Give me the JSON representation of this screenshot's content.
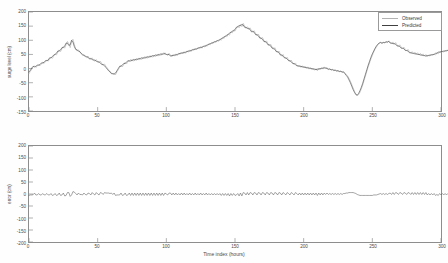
{
  "figure": {
    "background_color": "#fefefe",
    "axis_color": "#8d8d8d",
    "text_color": "#4a4a4a"
  },
  "legend": {
    "position": "top-right",
    "entries": [
      {
        "label": "Observed",
        "color": "#b2b2b2"
      },
      {
        "label": "Predicted",
        "color": "#404040"
      }
    ]
  },
  "chart_data": [
    {
      "id": "surge-level-panel",
      "type": "line",
      "title": "",
      "xlabel": "",
      "ylabel": "surge level (cm)",
      "xlim": [
        0,
        300
      ],
      "ylim": [
        -150,
        200
      ],
      "xticks": [
        0,
        50,
        100,
        150,
        200,
        250,
        300
      ],
      "yticks": [
        -150,
        -100,
        -50,
        0,
        50,
        100,
        150,
        200
      ],
      "grid": false,
      "legend_position": "upper right",
      "x_step": 1,
      "series": [
        {
          "name": "Observed",
          "color": "#b2b2b2",
          "values": [
            -18,
            -10,
            -2,
            5,
            10,
            4,
            8,
            14,
            10,
            16,
            22,
            18,
            25,
            30,
            26,
            34,
            40,
            36,
            44,
            52,
            48,
            58,
            66,
            60,
            70,
            78,
            72,
            84,
            96,
            88,
            74,
            96,
            104,
            86,
            70,
            62,
            66,
            58,
            52,
            46,
            50,
            42,
            38,
            44,
            36,
            32,
            38,
            30,
            26,
            32,
            24,
            20,
            26,
            18,
            12,
            16,
            8,
            2,
            -4,
            -10,
            -14,
            -20,
            -16,
            -22,
            -12,
            -4,
            4,
            12,
            6,
            14,
            22,
            16,
            24,
            30,
            24,
            32,
            26,
            34,
            28,
            36,
            30,
            38,
            32,
            40,
            34,
            42,
            36,
            44,
            38,
            46,
            40,
            48,
            42,
            50,
            44,
            52,
            46,
            54,
            48,
            56,
            50,
            46,
            54,
            48,
            42,
            50,
            44,
            52,
            46,
            54,
            50,
            58,
            52,
            60,
            54,
            62,
            58,
            66,
            60,
            68,
            64,
            72,
            66,
            74,
            70,
            78,
            72,
            80,
            76,
            84,
            80,
            88,
            84,
            92,
            88,
            96,
            92,
            100,
            96,
            104,
            100,
            110,
            106,
            116,
            112,
            122,
            118,
            130,
            126,
            136,
            132,
            142,
            150,
            144,
            156,
            148,
            160,
            150,
            142,
            148,
            138,
            144,
            134,
            128,
            134,
            124,
            116,
            122,
            112,
            104,
            110,
            100,
            92,
            98,
            88,
            80,
            86,
            76,
            68,
            74,
            64,
            56,
            62,
            52,
            44,
            50,
            40,
            34,
            40,
            30,
            24,
            30,
            20,
            14,
            20,
            12,
            6,
            12,
            4,
            10,
            2,
            8,
            0,
            6,
            -2,
            4,
            -4,
            2,
            -6,
            0,
            -8,
            2,
            -4,
            4,
            -2,
            6,
            0,
            4,
            -4,
            0,
            -6,
            -2,
            -8,
            -4,
            -10,
            -6,
            -12,
            -8,
            -14,
            -10,
            -16,
            -20,
            -26,
            -34,
            -44,
            -56,
            -68,
            -80,
            -90,
            -96,
            -92,
            -84,
            -72,
            -58,
            -42,
            -26,
            -10,
            6,
            20,
            34,
            46,
            58,
            68,
            76,
            84,
            90,
            94,
            88,
            94,
            90,
            96,
            92,
            98,
            94,
            88,
            94,
            86,
            92,
            84,
            78,
            84,
            76,
            70,
            76,
            68,
            62,
            68,
            60,
            54,
            60,
            52,
            58,
            50,
            56,
            48,
            54,
            46,
            52,
            44,
            50,
            42,
            48,
            44,
            50,
            46,
            52,
            48,
            56,
            52,
            60,
            56,
            62,
            58,
            64,
            60,
            66,
            62,
            58,
            64,
            60
          ]
        },
        {
          "name": "Predicted",
          "color": "#404040",
          "values": [
            -12,
            -6,
            2,
            8,
            6,
            8,
            12,
            12,
            14,
            20,
            20,
            22,
            28,
            28,
            30,
            38,
            38,
            42,
            48,
            50,
            54,
            62,
            62,
            66,
            74,
            74,
            80,
            90,
            90,
            82,
            84,
            100,
            94,
            78,
            68,
            66,
            62,
            60,
            54,
            50,
            46,
            44,
            42,
            40,
            34,
            36,
            32,
            30,
            30,
            26,
            24,
            24,
            20,
            14,
            14,
            10,
            4,
            -2,
            -8,
            -12,
            -18,
            -18,
            -20,
            -16,
            -8,
            0,
            8,
            8,
            12,
            18,
            18,
            22,
            28,
            26,
            30,
            28,
            32,
            30,
            34,
            32,
            36,
            34,
            38,
            36,
            40,
            38,
            42,
            40,
            44,
            42,
            46,
            44,
            48,
            46,
            50,
            48,
            52,
            50,
            54,
            52,
            50,
            50,
            50,
            44,
            46,
            46,
            48,
            48,
            50,
            52,
            54,
            54,
            56,
            56,
            58,
            60,
            62,
            62,
            64,
            66,
            68,
            68,
            70,
            72,
            74,
            74,
            76,
            78,
            80,
            80,
            84,
            86,
            88,
            90,
            92,
            94,
            96,
            98,
            100,
            102,
            106,
            108,
            112,
            114,
            118,
            120,
            126,
            128,
            132,
            134,
            138,
            146,
            148,
            152,
            152,
            156,
            154,
            146,
            146,
            142,
            142,
            138,
            130,
            132,
            128,
            120,
            120,
            116,
            108,
            108,
            104,
            96,
            96,
            92,
            84,
            84,
            80,
            72,
            72,
            68,
            60,
            60,
            56,
            48,
            48,
            44,
            38,
            38,
            34,
            28,
            28,
            24,
            18,
            18,
            14,
            10,
            10,
            8,
            8,
            6,
            6,
            4,
            4,
            2,
            2,
            0,
            0,
            -2,
            -2,
            -4,
            -2,
            -2,
            0,
            0,
            2,
            2,
            2,
            0,
            -2,
            -2,
            -4,
            -4,
            -6,
            -6,
            -8,
            -8,
            -10,
            -10,
            -12,
            -12,
            -18,
            -24,
            -30,
            -40,
            -50,
            -62,
            -74,
            -84,
            -92,
            -94,
            -88,
            -78,
            -66,
            -52,
            -36,
            -20,
            -4,
            12,
            26,
            40,
            52,
            62,
            72,
            80,
            86,
            90,
            92,
            90,
            92,
            92,
            94,
            94,
            96,
            90,
            90,
            88,
            88,
            86,
            80,
            80,
            78,
            72,
            72,
            70,
            64,
            64,
            62,
            56,
            56,
            54,
            54,
            52,
            52,
            50,
            50,
            48,
            48,
            46,
            46,
            44,
            46,
            46,
            48,
            48,
            50,
            50,
            54,
            54,
            58,
            58,
            60,
            60,
            62,
            62,
            64,
            64,
            60,
            60,
            62,
            62
          ]
        }
      ]
    },
    {
      "id": "error-panel",
      "type": "line",
      "title": "",
      "xlabel": "Time index (hours)",
      "ylabel": "error (cm)",
      "xlim": [
        0,
        300
      ],
      "ylim": [
        -200,
        200
      ],
      "xticks": [
        0,
        50,
        100,
        150,
        200,
        250,
        300
      ],
      "yticks": [
        -200,
        -150,
        -100,
        -50,
        0,
        50,
        100,
        150,
        200
      ],
      "grid": false,
      "x_step": 1,
      "series": [
        {
          "name": "error",
          "color": "#5a5a5a",
          "values": [
            -6,
            -4,
            -4,
            -3,
            4,
            -4,
            -4,
            2,
            -4,
            -4,
            2,
            -4,
            -3,
            2,
            -4,
            -4,
            2,
            -6,
            -4,
            2,
            -6,
            -4,
            4,
            -6,
            -4,
            4,
            -8,
            -6,
            6,
            6,
            -10,
            -4,
            10,
            8,
            2,
            -4,
            4,
            -2,
            -2,
            -4,
            4,
            -2,
            -4,
            4,
            2,
            -4,
            6,
            0,
            -4,
            6,
            0,
            -4,
            6,
            4,
            -2,
            6,
            4,
            4,
            4,
            2,
            4,
            -2,
            4,
            -6,
            -4,
            -4,
            -4,
            4,
            -6,
            -4,
            4,
            -6,
            -4,
            4,
            -6,
            4,
            -6,
            4,
            -6,
            4,
            -6,
            4,
            -6,
            4,
            -6,
            4,
            -6,
            4,
            -6,
            4,
            -6,
            4,
            -6,
            4,
            -6,
            4,
            -6,
            4,
            -6,
            4,
            0,
            -4,
            4,
            4,
            -4,
            4,
            -4,
            4,
            -4,
            2,
            -4,
            4,
            -4,
            4,
            -4,
            2,
            -4,
            4,
            -4,
            2,
            -4,
            4,
            -4,
            2,
            -4,
            4,
            -4,
            2,
            -4,
            4,
            -4,
            2,
            -4,
            2,
            -4,
            2,
            -4,
            2,
            -4,
            2,
            -6,
            2,
            -6,
            2,
            -6,
            2,
            -8,
            2,
            -6,
            2,
            -6,
            -4,
            2,
            -8,
            4,
            -8,
            6,
            4,
            -4,
            6,
            -4,
            6,
            4,
            -4,
            6,
            4,
            -4,
            6,
            4,
            -4,
            6,
            4,
            -4,
            6,
            4,
            -4,
            6,
            4,
            -4,
            6,
            4,
            -4,
            6,
            4,
            -4,
            6,
            2,
            -4,
            6,
            2,
            -4,
            6,
            2,
            -4,
            6,
            2,
            -4,
            4,
            -4,
            4,
            -4,
            4,
            -4,
            4,
            -4,
            4,
            -4,
            4,
            -4,
            4,
            -6,
            4,
            -4,
            4,
            -4,
            4,
            -2,
            4,
            -2,
            2,
            -2,
            2,
            -2,
            2,
            -2,
            2,
            -2,
            2,
            -2,
            2,
            2,
            4,
            4,
            6,
            6,
            6,
            6,
            4,
            2,
            -2,
            -4,
            -6,
            -6,
            -6,
            -6,
            -6,
            -6,
            -6,
            -6,
            -6,
            -6,
            -4,
            -4,
            -4,
            -2,
            0,
            2,
            -2,
            2,
            -2,
            2,
            -2,
            2,
            4,
            -2,
            6,
            -2,
            6,
            4,
            -2,
            6,
            4,
            -2,
            6,
            4,
            -2,
            6,
            4,
            -2,
            6,
            -2,
            6,
            -2,
            6,
            -2,
            6,
            -2,
            6,
            -2,
            6,
            -4,
            2,
            -4,
            2,
            -4,
            2,
            -6,
            -2,
            -6,
            2,
            -4,
            2,
            -4,
            2,
            -4,
            2,
            2,
            -2,
            2,
            -2
          ]
        }
      ]
    }
  ]
}
